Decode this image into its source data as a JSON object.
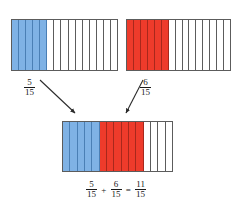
{
  "figure": {
    "denominator": 15,
    "colors": {
      "blue": "#7fb2e5",
      "red": "#ee3b2b",
      "empty": "#ffffff",
      "outline": "#5c5c5c",
      "text": "#1a1a1a"
    }
  },
  "bars": {
    "top_left": {
      "name": "five-fifteenths-bar",
      "total_cells": 15,
      "filled_cells": 5,
      "fill_color_name": "blue",
      "cells": [
        "blue",
        "blue",
        "blue",
        "blue",
        "blue",
        "empty",
        "empty",
        "empty",
        "empty",
        "empty",
        "empty",
        "empty",
        "empty",
        "empty",
        "empty"
      ],
      "label": {
        "numerator": "5",
        "denominator": "15"
      }
    },
    "top_right": {
      "name": "six-fifteenths-bar",
      "total_cells": 15,
      "filled_cells": 6,
      "fill_color_name": "red",
      "cells": [
        "red",
        "red",
        "red",
        "red",
        "red",
        "red",
        "empty",
        "empty",
        "empty",
        "empty",
        "empty",
        "empty",
        "empty",
        "empty",
        "empty"
      ],
      "label": {
        "numerator": "6",
        "denominator": "15"
      }
    },
    "result": {
      "name": "eleven-fifteenths-bar",
      "total_cells": 15,
      "filled_cells": 11,
      "blue_cells": 5,
      "red_cells": 6,
      "empty_cells": 4,
      "cells": [
        "blue",
        "blue",
        "blue",
        "blue",
        "blue",
        "red",
        "red",
        "red",
        "red",
        "red",
        "red",
        "empty",
        "empty",
        "empty",
        "empty"
      ]
    }
  },
  "equation": {
    "addend_one": {
      "numerator": "5",
      "denominator": "15"
    },
    "plus_sign": "+",
    "addend_two": {
      "numerator": "6",
      "denominator": "15"
    },
    "equals_sign": "=",
    "sum": {
      "numerator": "11",
      "denominator": "15"
    }
  },
  "arrows": [
    {
      "name": "arrow-from-left-bar",
      "direction": "down-right"
    },
    {
      "name": "arrow-from-right-bar",
      "direction": "down-left"
    }
  ]
}
